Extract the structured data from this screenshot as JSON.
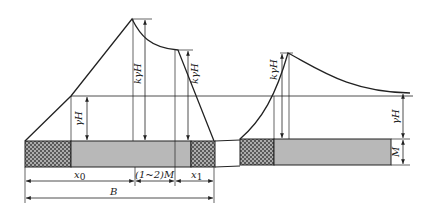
{
  "diagram": {
    "type": "abutment-pressure-distribution",
    "colors": {
      "line": "#222222",
      "seam_fill": "#b8b8b8",
      "hatch_fill": "#5a5a5a",
      "hatch_dot": "#c8c8c8",
      "background": "#ffffff"
    },
    "left_panel": {
      "labels": {
        "peak_stress": "kγH",
        "secondary_peak_stress": "kγH",
        "original_stress": "γH"
      },
      "dimensions": {
        "x0": "x",
        "x0_sub": "0",
        "gap": "(1~2)M",
        "x1": "x",
        "x1_sub": "1",
        "B": "B"
      }
    },
    "right_panel": {
      "labels": {
        "peak_stress": "kγH",
        "original_stress": "γH",
        "thickness": "M"
      }
    }
  }
}
